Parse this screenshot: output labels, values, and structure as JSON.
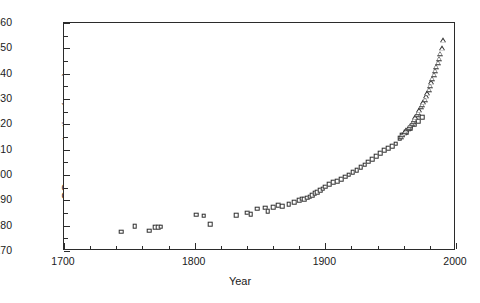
{
  "chart_data": {
    "type": "scatter",
    "title": "",
    "xlabel": "Year",
    "ylabel": "CO2 concentration (ppmv)",
    "ylabel_rich": {
      "prefix": "CO",
      "sub": "2",
      "suffix": " concentration (ppmv)"
    },
    "xlim": [
      1700,
      2000
    ],
    "ylim": [
      270,
      360
    ],
    "grid": false,
    "legend": "none",
    "x_major_ticks": [
      1700,
      1800,
      1900,
      2000
    ],
    "x_major_tick_labels": [
      "1700",
      "1800",
      "1900",
      "2000"
    ],
    "x_minor_tick_step": 20,
    "y_major_ticks": [
      270,
      280,
      290,
      300,
      310,
      320,
      330,
      340,
      350,
      360
    ],
    "y_major_tick_labels": [
      "270",
      "280",
      "290",
      "300",
      "310",
      "320",
      "330",
      "340",
      "350",
      "360"
    ],
    "y_minor_tick_step": 5,
    "series": [
      {
        "name": "ice-core-record",
        "marker": "open-square",
        "points": [
          [
            1744,
            277.6
          ],
          [
            1754,
            279.9
          ],
          [
            1765,
            278.0
          ],
          [
            1770,
            279.4
          ],
          [
            1772,
            279.5
          ],
          [
            1774,
            279.6
          ],
          [
            1801,
            284.3
          ],
          [
            1807,
            283.9
          ],
          [
            1812,
            280.6
          ],
          [
            1832,
            284.2
          ],
          [
            1840,
            285.1
          ],
          [
            1843,
            284.5
          ],
          [
            1848,
            286.7
          ],
          [
            1854,
            287.1
          ],
          [
            1856,
            285.6
          ],
          [
            1860,
            287.4
          ],
          [
            1864,
            288.0
          ],
          [
            1867,
            287.8
          ],
          [
            1872,
            288.4
          ],
          [
            1876,
            289.2
          ],
          [
            1880,
            290.1
          ],
          [
            1882,
            290.6
          ],
          [
            1884,
            290.4
          ],
          [
            1886,
            291.0
          ],
          [
            1888,
            291.4
          ],
          [
            1890,
            292.0
          ],
          [
            1892,
            292.7
          ],
          [
            1894,
            293.3
          ],
          [
            1896,
            293.9
          ],
          [
            1898,
            294.6
          ],
          [
            1900,
            295.4
          ],
          [
            1903,
            296.4
          ],
          [
            1906,
            297.2
          ],
          [
            1909,
            297.6
          ],
          [
            1912,
            298.4
          ],
          [
            1915,
            299.3
          ],
          [
            1918,
            300.1
          ],
          [
            1921,
            301.0
          ],
          [
            1924,
            302.0
          ],
          [
            1927,
            303.0
          ],
          [
            1930,
            304.0
          ],
          [
            1933,
            305.2
          ],
          [
            1936,
            306.3
          ],
          [
            1939,
            307.4
          ],
          [
            1942,
            308.5
          ],
          [
            1945,
            309.8
          ],
          [
            1948,
            310.6
          ],
          [
            1951,
            311.4
          ],
          [
            1954,
            312.4
          ],
          [
            1957,
            314.6
          ],
          [
            1959,
            315.9
          ],
          [
            1962,
            317.0
          ],
          [
            1965,
            318.5
          ],
          [
            1968,
            319.8
          ],
          [
            1971,
            321.2
          ],
          [
            1974,
            322.8
          ]
        ]
      },
      {
        "name": "atmospheric-record",
        "marker": "open-triangle",
        "points": [
          [
            1958,
            315.0
          ],
          [
            1959,
            315.8
          ],
          [
            1960,
            316.4
          ],
          [
            1961,
            317.0
          ],
          [
            1962,
            317.6
          ],
          [
            1963,
            318.1
          ],
          [
            1964,
            318.7
          ],
          [
            1965,
            319.3
          ],
          [
            1966,
            320.1
          ],
          [
            1967,
            320.9
          ],
          [
            1968,
            321.7
          ],
          [
            1969,
            322.7
          ],
          [
            1970,
            323.7
          ],
          [
            1971,
            324.5
          ],
          [
            1972,
            325.5
          ],
          [
            1973,
            326.8
          ],
          [
            1974,
            327.8
          ],
          [
            1975,
            328.7
          ],
          [
            1976,
            329.8
          ],
          [
            1977,
            331.0
          ],
          [
            1978,
            332.2
          ],
          [
            1979,
            333.6
          ],
          [
            1980,
            335.2
          ],
          [
            1981,
            336.6
          ],
          [
            1982,
            338.0
          ],
          [
            1983,
            339.6
          ],
          [
            1984,
            341.1
          ],
          [
            1985,
            342.6
          ],
          [
            1986,
            344.2
          ],
          [
            1987,
            345.9
          ],
          [
            1988,
            347.8
          ],
          [
            1989,
            350.0
          ],
          [
            1990,
            353.2
          ]
        ]
      }
    ]
  }
}
